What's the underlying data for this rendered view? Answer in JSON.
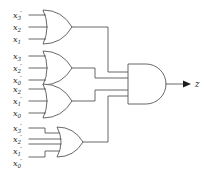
{
  "diagram": {
    "background_color": "#ffffff",
    "wire_color": "#58585a",
    "text_color": "#2b2b2b",
    "output": {
      "label": "z",
      "var": "z",
      "prime": "",
      "sub": ""
    },
    "gates": [
      {
        "id": "or-gate-1",
        "type": "OR",
        "input_count": 3,
        "inputs": [
          {
            "var": "x",
            "sub": "3",
            "prime": "′",
            "text": "x3′"
          },
          {
            "var": "x",
            "sub": "2",
            "prime": "",
            "text": "x2"
          },
          {
            "var": "x",
            "sub": "1",
            "prime": "",
            "text": "x1"
          }
        ]
      },
      {
        "id": "or-gate-2",
        "type": "OR",
        "input_count": 3,
        "inputs": [
          {
            "var": "x",
            "sub": "3",
            "prime": "",
            "text": "x3"
          },
          {
            "var": "x",
            "sub": "2",
            "prime": "′",
            "text": "x2′"
          },
          {
            "var": "x",
            "sub": "0",
            "prime": "′",
            "text": "x0′"
          }
        ]
      },
      {
        "id": "or-gate-3",
        "type": "OR",
        "input_count": 3,
        "inputs": [
          {
            "var": "x",
            "sub": "2",
            "prime": "",
            "text": "x2"
          },
          {
            "var": "x",
            "sub": "1",
            "prime": "′",
            "text": "x1′"
          },
          {
            "var": "x",
            "sub": "0",
            "prime": "",
            "text": "x0"
          }
        ]
      },
      {
        "id": "or-gate-4",
        "type": "OR",
        "input_count": 4,
        "inputs": [
          {
            "var": "x",
            "sub": "3",
            "prime": "′",
            "text": "x3′"
          },
          {
            "var": "x",
            "sub": "2",
            "prime": "′",
            "text": "x2′"
          },
          {
            "var": "x",
            "sub": "1",
            "prime": "′",
            "text": "x1′"
          },
          {
            "var": "x",
            "sub": "0",
            "prime": "′",
            "text": "x0′"
          }
        ]
      },
      {
        "id": "and-gate-1",
        "type": "AND",
        "input_count": 4,
        "inputs": []
      }
    ]
  }
}
